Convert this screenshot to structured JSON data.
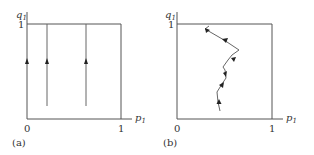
{
  "panels": [
    {
      "id": "a",
      "caption": "(a)",
      "y_axis_label": "q",
      "y_axis_sub": "1",
      "x_axis_label": "p",
      "x_axis_sub": "1",
      "y_tick_top": "1",
      "x_tick_origin": "0",
      "x_tick_right": "1",
      "description": "Three vertical trajectories at constant p1 rising toward q1 = 1",
      "trajectories_p1": [
        0.0,
        0.2,
        0.6
      ]
    },
    {
      "id": "b",
      "caption": "(b)",
      "y_axis_label": "q",
      "y_axis_sub": "1",
      "x_axis_label": "p",
      "x_axis_sub": "1",
      "y_tick_top": "1",
      "x_tick_origin": "0",
      "x_tick_right": "1",
      "description": "Zigzag trajectory in (p1, q1) rising toward q1 = 1"
    }
  ],
  "colors": {
    "axis": "#555555",
    "line": "#666666",
    "arrow": "#222222",
    "text": "#333333"
  }
}
